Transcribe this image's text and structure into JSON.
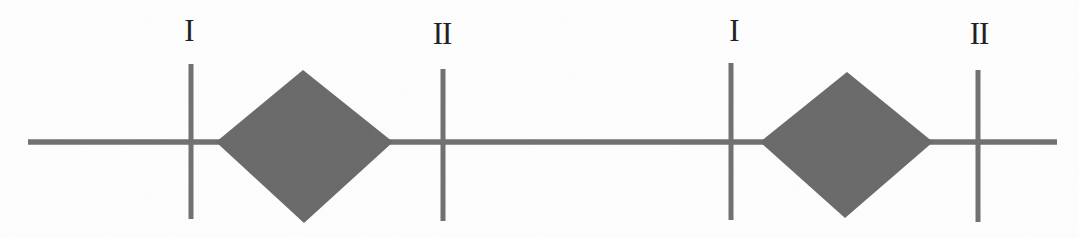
{
  "figure": {
    "groups": [
      {
        "plane1_label": "I",
        "plane2_label": "II"
      },
      {
        "plane1_label": "I",
        "plane2_label": "II"
      }
    ],
    "colors": {
      "background": "#fefefe",
      "stroke": "#717171",
      "diamond_fill": "#6a6a6a",
      "label": "#1f1f1f"
    }
  }
}
